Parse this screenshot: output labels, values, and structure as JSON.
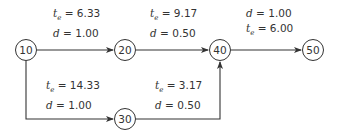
{
  "diagram": {
    "type": "activity-network",
    "nodes": [
      {
        "id": "10",
        "label": "10",
        "x": 26,
        "y": 50
      },
      {
        "id": "20",
        "label": "20",
        "x": 125,
        "y": 50
      },
      {
        "id": "30",
        "label": "30",
        "x": 125,
        "y": 119
      },
      {
        "id": "40",
        "label": "40",
        "x": 220,
        "y": 50
      },
      {
        "id": "50",
        "label": "50",
        "x": 313,
        "y": 50
      }
    ],
    "edges": [
      {
        "from": "10",
        "to": "20",
        "te": "6.33",
        "d": "1.00",
        "line1": {
          "var": "t",
          "sub": "e",
          "eq": " = 6.33"
        },
        "line2": {
          "var": "d",
          "eq": " = 1.00"
        }
      },
      {
        "from": "20",
        "to": "40",
        "te": "9.17",
        "d": "0.50",
        "line1": {
          "var": "t",
          "sub": "e",
          "eq": " = 9.17"
        },
        "line2": {
          "var": "d",
          "eq": " = 0.50"
        }
      },
      {
        "from": "40",
        "to": "50",
        "te": "6.00",
        "d": "1.00",
        "line1": {
          "var": "d",
          "eq": " = 1.00"
        },
        "line2": {
          "var": "t",
          "sub": "e",
          "eq": " = 6.00"
        }
      },
      {
        "from": "10",
        "to": "30",
        "te": "14.33",
        "d": "1.00",
        "line1": {
          "var": "t",
          "sub": "e",
          "eq": " = 14.33"
        },
        "line2": {
          "var": "d",
          "eq": " = 1.00"
        }
      },
      {
        "from": "30",
        "to": "40",
        "te": "3.17",
        "d": "0.50",
        "line1": {
          "var": "t",
          "sub": "e",
          "eq": " = 3.17"
        },
        "line2": {
          "var": "d",
          "eq": " = 0.50"
        }
      }
    ]
  }
}
